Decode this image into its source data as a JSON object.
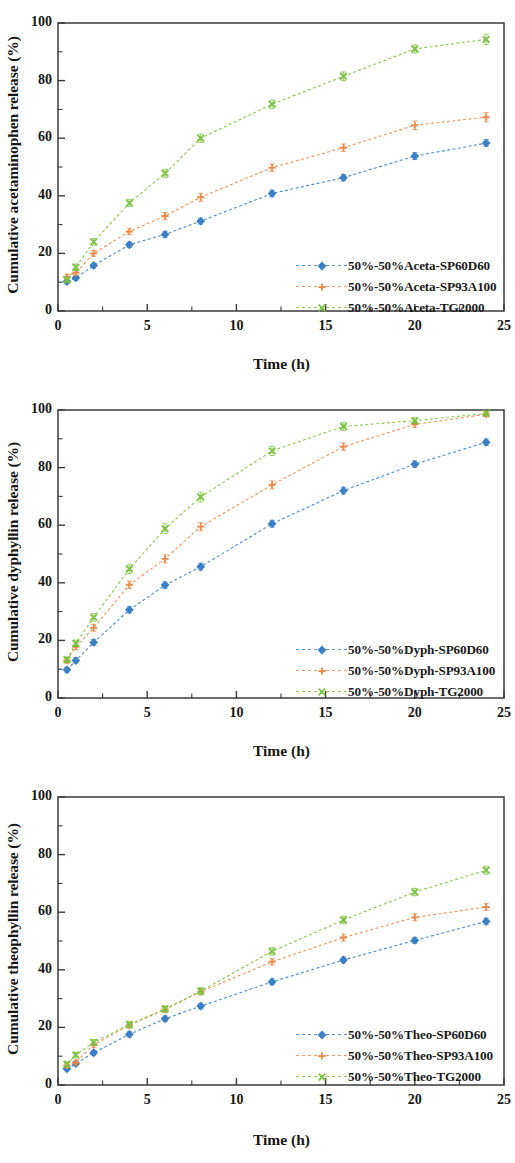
{
  "figure": {
    "panel_count": 3,
    "series_colors": {
      "sp60d60": "#3b7fc4",
      "sp93a100": "#eb8c4f",
      "tg2000": "#7dc242"
    }
  },
  "panels": [
    {
      "id": "acetaminophen",
      "ylabel": "Cumulative acetaminophen release (%)",
      "xlabel": "Time (h)",
      "ytick_labels": [
        "0",
        "20",
        "40",
        "60",
        "80",
        "100"
      ],
      "xtick_labels": [
        "0",
        "5",
        "10",
        "15",
        "20",
        "25"
      ],
      "legend": [
        {
          "label": "50%-50%Aceta-SP60D60",
          "marker": "diamond",
          "color": "#3b7fc4"
        },
        {
          "label": "50%-50%Aceta-SP93A100",
          "marker": "plus",
          "color": "#eb8c4f"
        },
        {
          "label": "50%-50%Aceta-TG2000",
          "marker": "cross",
          "color": "#7dc242"
        }
      ]
    },
    {
      "id": "dyphyllin",
      "ylabel": "Cumulative dyphyllin release (%)",
      "xlabel": "Time (h)",
      "ytick_labels": [
        "0",
        "20",
        "40",
        "60",
        "80",
        "100"
      ],
      "xtick_labels": [
        "0",
        "5",
        "10",
        "15",
        "20",
        "25"
      ],
      "legend": [
        {
          "label": "50%-50%Dyph-SP60D60",
          "marker": "diamond",
          "color": "#3b7fc4"
        },
        {
          "label": "50%-50%Dyph-SP93A100",
          "marker": "plus",
          "color": "#eb8c4f"
        },
        {
          "label": "50%-50%Dyph-TG2000",
          "marker": "cross",
          "color": "#7dc242"
        }
      ]
    },
    {
      "id": "theophyllin",
      "ylabel": "Cumulative theophyllin release (%)",
      "xlabel": "Time (h)",
      "ytick_labels": [
        "0",
        "20",
        "40",
        "60",
        "80",
        "100"
      ],
      "xtick_labels": [
        "0",
        "5",
        "10",
        "15",
        "20",
        "25"
      ],
      "legend": [
        {
          "label": "50%-50%Theo-SP60D60",
          "marker": "diamond",
          "color": "#3b7fc4"
        },
        {
          "label": "50%-50%Theo-SP93A100",
          "marker": "plus",
          "color": "#eb8c4f"
        },
        {
          "label": "50%-50%Theo-TG2000",
          "marker": "cross",
          "color": "#7dc242"
        }
      ]
    }
  ],
  "chart_data": [
    {
      "type": "line",
      "title": "",
      "xlabel": "Time (h)",
      "ylabel": "Cumulative acetaminophen release (%)",
      "xlim": [
        0,
        25
      ],
      "ylim": [
        0,
        100
      ],
      "xticks": [
        0,
        5,
        10,
        15,
        20,
        25
      ],
      "yticks": [
        0,
        20,
        40,
        60,
        80,
        100
      ],
      "grid": false,
      "legend_position": "lower-right",
      "x": [
        0.5,
        1,
        2,
        4,
        6,
        8,
        12,
        16,
        20,
        24
      ],
      "series": [
        {
          "name": "50%-50%Aceta-SP60D60",
          "color": "#3b7fc4",
          "marker": "diamond",
          "values": [
            10.2,
            11.5,
            15.8,
            23.0,
            26.6,
            31.2,
            40.8,
            46.3,
            53.8,
            58.3
          ],
          "errors": [
            0.8,
            0.8,
            0.8,
            0.9,
            1.0,
            1.0,
            1.1,
            1.1,
            1.2,
            1.2
          ]
        },
        {
          "name": "50%-50%Aceta-SP93A100",
          "color": "#eb8c4f",
          "marker": "plus",
          "values": [
            11.8,
            13.3,
            20.0,
            27.6,
            33.0,
            39.5,
            49.8,
            56.7,
            64.5,
            67.3
          ],
          "errors": [
            0.9,
            0.9,
            1.0,
            1.1,
            1.2,
            1.4,
            1.3,
            1.3,
            1.5,
            1.6
          ]
        },
        {
          "name": "50%-50%Aceta-TG2000",
          "color": "#7dc242",
          "marker": "cross",
          "values": [
            10.8,
            15.2,
            24.0,
            37.5,
            47.8,
            60.0,
            71.8,
            81.5,
            91.0,
            94.3
          ],
          "errors": [
            1.0,
            1.1,
            1.2,
            1.3,
            1.4,
            1.5,
            1.5,
            1.5,
            1.4,
            1.8
          ]
        }
      ]
    },
    {
      "type": "line",
      "title": "",
      "xlabel": "Time (h)",
      "ylabel": "Cumulative dyphyllin release (%)",
      "xlim": [
        0,
        25
      ],
      "ylim": [
        0,
        100
      ],
      "xticks": [
        0,
        5,
        10,
        15,
        20,
        25
      ],
      "yticks": [
        0,
        20,
        40,
        60,
        80,
        100
      ],
      "grid": false,
      "legend_position": "lower-right",
      "x": [
        0.5,
        1,
        2,
        4,
        6,
        8,
        12,
        16,
        20,
        24
      ],
      "series": [
        {
          "name": "50%-50%Dyph-SP60D60",
          "color": "#3b7fc4",
          "marker": "diamond",
          "values": [
            9.8,
            13.0,
            19.3,
            30.6,
            39.2,
            45.6,
            60.5,
            72.0,
            81.2,
            88.8
          ],
          "errors": [
            0.8,
            0.9,
            1.0,
            1.1,
            1.1,
            1.2,
            1.2,
            1.2,
            1.1,
            1.1
          ]
        },
        {
          "name": "50%-50%Dyph-SP93A100",
          "color": "#eb8c4f",
          "marker": "plus",
          "values": [
            13.0,
            17.8,
            24.4,
            39.3,
            48.3,
            59.5,
            74.0,
            87.3,
            95.0,
            98.5
          ],
          "errors": [
            0.9,
            1.0,
            1.2,
            1.3,
            1.4,
            1.4,
            1.4,
            1.3,
            1.1,
            0.8
          ]
        },
        {
          "name": "50%-50%Dyph-TG2000",
          "color": "#7dc242",
          "marker": "cross",
          "values": [
            13.3,
            19.0,
            28.0,
            44.8,
            58.8,
            69.8,
            85.8,
            94.3,
            96.3,
            98.8
          ],
          "errors": [
            1.0,
            1.1,
            1.3,
            1.6,
            1.7,
            1.7,
            1.6,
            1.4,
            1.0,
            0.8
          ]
        }
      ]
    },
    {
      "type": "line",
      "title": "",
      "xlabel": "Time (h)",
      "ylabel": "Cumulative theophyllin release (%)",
      "xlim": [
        0,
        25
      ],
      "ylim": [
        0,
        100
      ],
      "xticks": [
        0,
        5,
        10,
        15,
        20,
        25
      ],
      "yticks": [
        0,
        20,
        40,
        60,
        80,
        100
      ],
      "grid": false,
      "legend_position": "lower-right",
      "x": [
        0.5,
        1,
        2,
        4,
        6,
        8,
        12,
        16,
        20,
        24
      ],
      "series": [
        {
          "name": "50%-50%Theo-SP60D60",
          "color": "#3b7fc4",
          "marker": "diamond",
          "values": [
            5.6,
            7.4,
            11.2,
            17.6,
            23.0,
            27.4,
            35.8,
            43.4,
            50.2,
            56.8
          ],
          "errors": [
            0.7,
            0.7,
            0.8,
            0.9,
            0.9,
            1.0,
            1.0,
            1.0,
            1.0,
            1.1
          ]
        },
        {
          "name": "50%-50%Theo-SP93A100",
          "color": "#eb8c4f",
          "marker": "plus",
          "values": [
            6.8,
            7.8,
            14.0,
            20.8,
            26.2,
            32.4,
            42.8,
            51.2,
            58.2,
            61.8
          ],
          "errors": [
            0.8,
            0.8,
            0.9,
            1.0,
            1.0,
            1.1,
            1.1,
            1.2,
            1.2,
            1.2
          ]
        },
        {
          "name": "50%-50%Theo-TG2000",
          "color": "#7dc242",
          "marker": "cross",
          "values": [
            7.2,
            10.4,
            14.8,
            21.0,
            26.4,
            32.6,
            46.4,
            57.3,
            67.0,
            74.6
          ],
          "errors": [
            0.9,
            0.9,
            1.0,
            1.1,
            1.1,
            1.2,
            1.3,
            1.3,
            1.3,
            1.4
          ]
        }
      ]
    }
  ]
}
